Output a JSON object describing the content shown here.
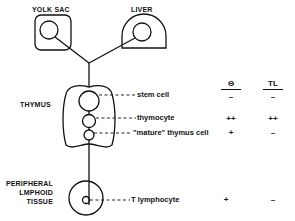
{
  "organs": {
    "yolk_sac": "YOLK  SAC",
    "liver": "LIVER",
    "thymus": "THYMUS",
    "peripheral": [
      "PERIPHERAL",
      "LMPHOID",
      "TISSUE"
    ]
  },
  "cells": {
    "stem_cell": "stem cell",
    "thymocyte": "thymocyte",
    "mature_thymus_cell": "\"mature\" thymus cell",
    "t_lymphocyte": "T  lymphocyte"
  },
  "table": {
    "headers": [
      "Θ",
      "TL"
    ],
    "rows": [
      {
        "cell": "stem cell",
        "theta": "–",
        "tl": "–"
      },
      {
        "cell": "thymocyte",
        "theta": "++",
        "tl": "++"
      },
      {
        "cell": "\"mature\" thymus cell",
        "theta": "+",
        "tl": "–"
      },
      {
        "cell": "T lymphocyte",
        "theta": "+",
        "tl": "–"
      }
    ]
  }
}
